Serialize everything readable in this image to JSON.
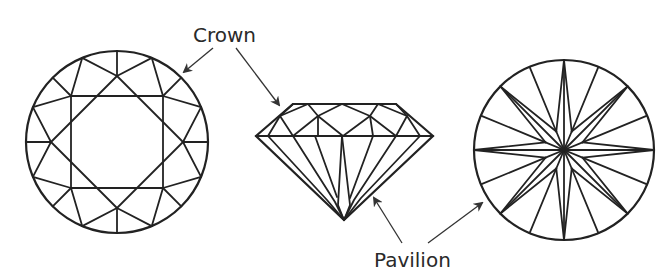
{
  "labels": {
    "crown": "Crown",
    "pavilion": "Pavilion"
  },
  "figures": [
    {
      "name": "top-view-crown",
      "description": "Round brilliant diamond viewed from the top (crown facets)"
    },
    {
      "name": "side-view",
      "description": "Round brilliant diamond viewed from the side"
    },
    {
      "name": "bottom-view-pavilion",
      "description": "Round brilliant diamond viewed from the bottom (pavilion facets)"
    }
  ],
  "colors": {
    "line": "#222222",
    "background": "#ffffff",
    "text": "#2a2a2a"
  }
}
